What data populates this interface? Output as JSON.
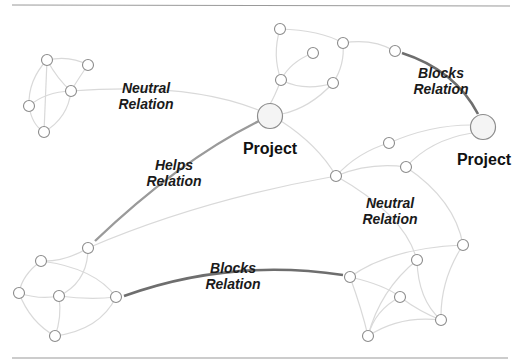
{
  "diagram": {
    "projects": [
      {
        "id": "project-center",
        "label": "Project",
        "x": 270,
        "y": 116,
        "r": 13
      },
      {
        "id": "project-right",
        "label": "Project",
        "x": 483,
        "y": 127,
        "r": 13
      }
    ],
    "relations": [
      {
        "type": "neutral",
        "label_line1": "Neutral",
        "label_line2": "Relation",
        "x": 146,
        "y": 92
      },
      {
        "type": "blocks",
        "label_line1": "Blocks",
        "label_line2": "Relation",
        "x": 440,
        "y": 77
      },
      {
        "type": "helps",
        "label_line1": "Helps",
        "label_line2": "Relation",
        "x": 173,
        "y": 168
      },
      {
        "type": "neutral",
        "label_line1": "Neutral",
        "label_line2": "Relation",
        "x": 389,
        "y": 208
      },
      {
        "type": "blocks",
        "label_line1": "Blocks",
        "label_line2": "Relation",
        "x": 233,
        "y": 275
      }
    ],
    "colors": {
      "neutral_edge": "#d9d9d9",
      "helps_edge": "#9a9a9a",
      "blocks_edge": "#6e6e6e",
      "node_stroke": "#8c8c8c"
    }
  }
}
